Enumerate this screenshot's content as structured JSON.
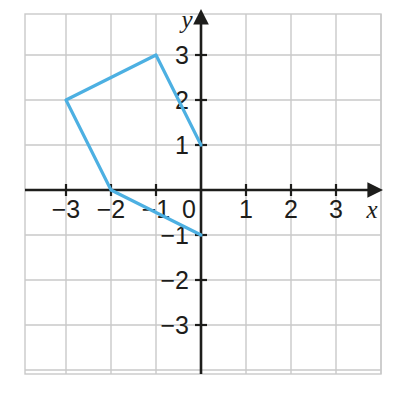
{
  "figure": {
    "kind": "coordinate-plane-polyline",
    "background_color": "#ffffff",
    "grid_color": "#c9c9c9",
    "axis_color": "#1d1d1b",
    "polyline_color": "#4db0e2",
    "polyline_width": 3.2
  },
  "axes": {
    "x_label": "x",
    "y_label": "y",
    "origin_label": "0",
    "x_ticks": [
      {
        "value": -3,
        "label": "−3"
      },
      {
        "value": -2,
        "label": "−2"
      },
      {
        "value": -1,
        "label": "−1"
      },
      {
        "value": 1,
        "label": "1"
      },
      {
        "value": 2,
        "label": "2"
      },
      {
        "value": 3,
        "label": "3"
      }
    ],
    "y_ticks": [
      {
        "value": 3,
        "label": "3"
      },
      {
        "value": 2,
        "label": "2"
      },
      {
        "value": 1,
        "label": "1"
      },
      {
        "value": -1,
        "label": "−1"
      },
      {
        "value": -2,
        "label": "−2"
      },
      {
        "value": -3,
        "label": "−3"
      }
    ]
  },
  "chart_data": {
    "type": "line",
    "title": "",
    "xlabel": "x",
    "ylabel": "y",
    "xlim": [
      -3.9,
      4.0
    ],
    "ylim": [
      -4.0,
      4.1
    ],
    "grid": true,
    "legend": false,
    "series": [
      {
        "name": "polyline",
        "color": "#4db0e2",
        "closed": false,
        "points": [
          {
            "x": 0,
            "y": 1
          },
          {
            "x": -1,
            "y": 3
          },
          {
            "x": -3,
            "y": 2
          },
          {
            "x": -2,
            "y": 0
          },
          {
            "x": 0,
            "y": -1
          }
        ]
      }
    ],
    "x": [
      0,
      -1,
      -3,
      -2,
      0
    ],
    "values": [
      1,
      3,
      2,
      0,
      -1
    ]
  }
}
